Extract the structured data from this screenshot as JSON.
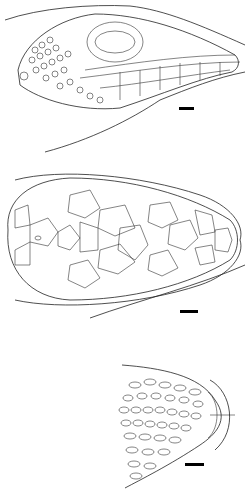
{
  "figure": {
    "panels": [
      {
        "view": "lateral",
        "scale_bar": {
          "x": 179,
          "y": 107,
          "w": 15,
          "h": 3
        }
      },
      {
        "view": "dorsal",
        "scale_bar": {
          "x": 180,
          "y": 310,
          "w": 18,
          "h": 3
        }
      },
      {
        "view": "ventral-chin",
        "scale_bar": {
          "x": 185,
          "y": 463,
          "w": 19,
          "h": 3
        }
      }
    ],
    "colors": {
      "line": "#333333",
      "bar": "#000000",
      "background": "#ffffff"
    }
  }
}
